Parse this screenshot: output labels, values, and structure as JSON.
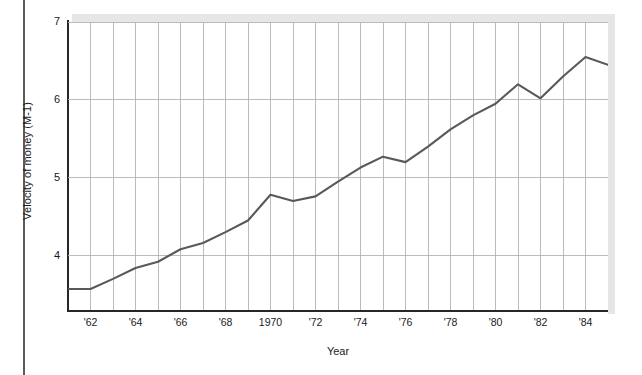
{
  "figure": {
    "background_color": "#ffffff",
    "line_color": "#595959",
    "grid_color": "#b5b5b5",
    "axis_color": "#262626",
    "shadow_color": "#e6e6e6"
  },
  "axes": {
    "ylabel": "Velocity of money (M-1)",
    "xlabel": "Year",
    "yticks": [
      "4",
      "5",
      "6",
      "7"
    ],
    "xticks": [
      "'62",
      "'64",
      "'66",
      "'68",
      "1970",
      "'72",
      "'74",
      "'76",
      "'78",
      "'80",
      "'82",
      "'84"
    ]
  },
  "chart_data": {
    "type": "line",
    "title": "",
    "xlabel": "Year",
    "ylabel": "Velocity of money (M-1)",
    "xlim": [
      1961,
      1985
    ],
    "ylim": [
      3.3,
      7.0
    ],
    "grid": true,
    "legend": false,
    "x": [
      1961,
      1962,
      1963,
      1964,
      1965,
      1966,
      1967,
      1968,
      1969,
      1970,
      1971,
      1972,
      1973,
      1974,
      1975,
      1976,
      1977,
      1978,
      1979,
      1980,
      1981,
      1982,
      1983,
      1984,
      1985
    ],
    "xtick_values": [
      1962,
      1964,
      1966,
      1968,
      1970,
      1972,
      1974,
      1976,
      1978,
      1980,
      1982,
      1984
    ],
    "xtick_labels": [
      "'62",
      "'64",
      "'66",
      "'68",
      "1970",
      "'72",
      "'74",
      "'76",
      "'78",
      "'80",
      "'82",
      "'84"
    ],
    "ytick_values": [
      4,
      5,
      6,
      7
    ],
    "ytick_labels": [
      "4",
      "5",
      "6",
      "7"
    ],
    "series": [
      {
        "name": "Velocity of money (M-1)",
        "color": "#595959",
        "values": [
          3.57,
          3.57,
          3.7,
          3.84,
          3.92,
          4.08,
          4.16,
          4.3,
          4.45,
          4.78,
          4.7,
          4.76,
          4.95,
          5.13,
          5.27,
          5.2,
          5.4,
          5.62,
          5.8,
          5.95,
          6.2,
          6.02,
          6.3,
          6.55,
          6.45
        ]
      }
    ],
    "annotations": []
  }
}
